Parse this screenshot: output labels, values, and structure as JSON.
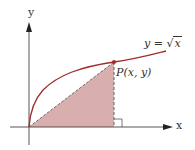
{
  "diagram": {
    "type": "function-graph",
    "axes": {
      "x_label": "x",
      "y_label": "y"
    },
    "curve": {
      "label": "y = √x",
      "label_lhs": "y =",
      "label_radicand": "x",
      "color": "#a32a2a"
    },
    "point": {
      "label": "P(x, y)",
      "color": "#a32a2a"
    },
    "shaded_triangle": {
      "fill": "#d9aeae",
      "description": "Triangle with vertices at origin, P(x, y) and (x, 0); right angle at (x, 0)"
    },
    "colors": {
      "axis": "#444444",
      "hypotenuse": "#555555",
      "dashed_leg": "#555555"
    }
  }
}
